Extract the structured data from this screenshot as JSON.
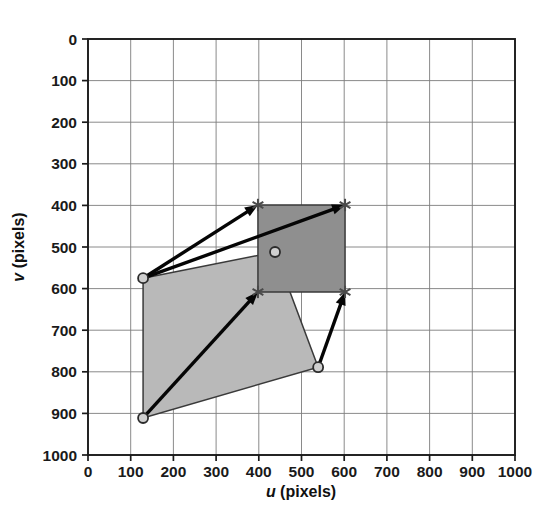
{
  "chart_data": {
    "type": "scatter",
    "title": "",
    "xlabel": "u (pixels)",
    "ylabel": "v (pixels)",
    "xlim": [
      0,
      1000
    ],
    "ylim": [
      0,
      1000
    ],
    "y_inverted": true,
    "grid": true,
    "legend_position": "none",
    "xticks": [
      0,
      100,
      200,
      300,
      400,
      500,
      600,
      700,
      800,
      900,
      1000
    ],
    "yticks": [
      0,
      100,
      200,
      300,
      400,
      500,
      600,
      700,
      800,
      900,
      1000
    ],
    "xtick_labels": [
      "0",
      "100",
      "200",
      "300",
      "400",
      "500",
      "600",
      "700",
      "800",
      "900",
      "1000"
    ],
    "ytick_labels": [
      "0",
      "100",
      "200",
      "300",
      "400",
      "500",
      "600",
      "700",
      "800",
      "900",
      "1000"
    ],
    "series": [
      {
        "name": "source-quadrilateral",
        "type": "polygon",
        "marker": "circle",
        "fill_color": "#b9b9b9",
        "edge_color": "#3a3a3a",
        "points": [
          {
            "u": 129,
            "v": 575
          },
          {
            "u": 438,
            "v": 512
          },
          {
            "u": 539,
            "v": 789
          },
          {
            "u": 129,
            "v": 911
          }
        ]
      },
      {
        "name": "target-quadrilateral",
        "type": "polygon",
        "marker": "asterisk",
        "fill_color": "#8f8f8f",
        "edge_color": "#3a3a3a",
        "points": [
          {
            "u": 398,
            "v": 399
          },
          {
            "u": 602,
            "v": 399
          },
          {
            "u": 602,
            "v": 608
          },
          {
            "u": 398,
            "v": 608
          }
        ]
      }
    ],
    "annotations": [
      {
        "name": "arrow-1",
        "type": "arrow",
        "from": {
          "u": 129,
          "v": 575
        },
        "to": {
          "u": 398,
          "v": 399
        }
      },
      {
        "name": "arrow-2",
        "type": "arrow",
        "from": {
          "u": 129,
          "v": 575
        },
        "to": {
          "u": 602,
          "v": 399
        }
      },
      {
        "name": "arrow-3",
        "type": "arrow",
        "from": {
          "u": 129,
          "v": 911
        },
        "to": {
          "u": 398,
          "v": 608
        }
      },
      {
        "name": "arrow-4",
        "type": "arrow",
        "from": {
          "u": 539,
          "v": 789
        },
        "to": {
          "u": 602,
          "v": 608
        }
      }
    ]
  },
  "axes": {
    "x_axis_label_symbol": "u",
    "x_axis_label_unit": " (pixels)",
    "y_axis_label_symbol": "v",
    "y_axis_label_unit": " (pixels)"
  },
  "colors": {
    "background": "#ffffff",
    "grid": "#7d7d7d",
    "frame": "#1a1a1a",
    "source_fill": "#b9b9b9",
    "target_fill": "#8f8f8f",
    "arrow": "#050505",
    "text": "#111111"
  }
}
